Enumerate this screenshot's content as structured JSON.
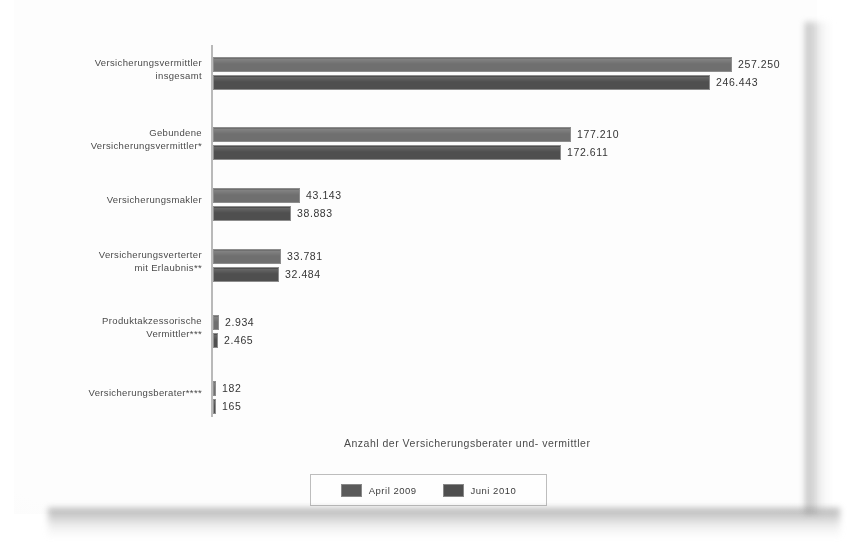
{
  "chart_data": {
    "type": "bar",
    "orientation": "horizontal",
    "title": "Anzahl der Versicherungsberater und- vermittler",
    "title_position": "bottom",
    "xlabel": "",
    "ylabel": "",
    "grid": false,
    "legend_position": "bottom-center",
    "xlim": [
      0,
      257250
    ],
    "categories": [
      "Versicherungsvermittler insgesamt",
      "Gebundene Versicherungsvermittler*",
      "Versicherungsmakler",
      "Versicherungsverterter mit Erlaubnis**",
      "Produktakzessorische Vermittler***",
      "Versicherungsberater****"
    ],
    "category_lines": [
      [
        "Versicherungsvermittler",
        "insgesamt"
      ],
      [
        "Gebundene",
        "Versicherungsvermittler*"
      ],
      [
        "Versicherungsmakler"
      ],
      [
        "Versicherungsverterter",
        "mit Erlaubnis**"
      ],
      [
        "Produktakzessorische",
        "Vermittler***"
      ],
      [
        "Versicherungsberater****"
      ]
    ],
    "series": [
      {
        "name": "April 2009",
        "color": "#6f6f6f",
        "values": [
          257250,
          177210,
          43143,
          33781,
          2934,
          182
        ],
        "labels": [
          "257.250",
          "177.210",
          "43.143",
          "33.781",
          "2.934",
          "182"
        ]
      },
      {
        "name": "Juni 2010",
        "color": "#4f4f4f",
        "values": [
          246443,
          172611,
          38883,
          32484,
          2465,
          165
        ],
        "labels": [
          "246.443",
          "172.611",
          "38.883",
          "32.484",
          "2.465",
          "165"
        ]
      }
    ]
  },
  "legend": {
    "entries": [
      {
        "label": "April 2009",
        "swatch": "legend-swatch-april-2009"
      },
      {
        "label": "Juni 2010",
        "swatch": "legend-swatch-juni-2010"
      }
    ]
  }
}
